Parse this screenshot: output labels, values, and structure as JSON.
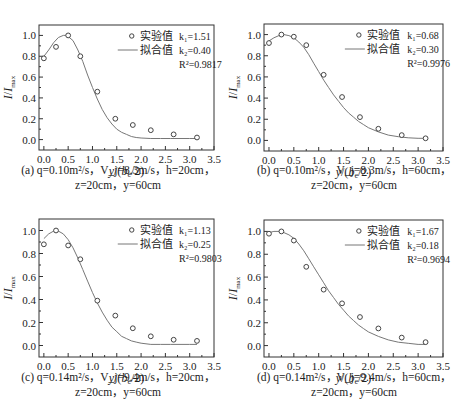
{
  "chart_data": [
    {
      "id": "a",
      "type": "line",
      "frame": {
        "left": 39,
        "top": 25,
        "right": 214,
        "bottom": 150
      },
      "xlim": [
        -0.1,
        3.5
      ],
      "ylim": [
        -0.1,
        1.1
      ],
      "xticks": [
        0.0,
        0.5,
        1.0,
        1.5,
        2.0,
        2.5,
        3.0,
        3.5
      ],
      "xtick_labels": [
        "0.0",
        "0.5",
        "1.0",
        "1.5",
        "2.0",
        "2.5",
        "3.0",
        "3.5"
      ],
      "yticks": [
        0.0,
        0.2,
        0.4,
        0.6,
        0.8,
        1.0
      ],
      "ytick_labels": [
        "0.0",
        "0.2",
        "0.4",
        "0.6",
        "0.8",
        "1.0"
      ],
      "xlabel": "y/(b_e/2)",
      "ylabel": "I/I_max",
      "legend": {
        "points": "实验值",
        "line": "拟合值"
      },
      "params": {
        "k1": "k₁=1.51",
        "k2": "k₂=0.40",
        "r2": "R²=0.9817"
      },
      "k1": 1.51,
      "k2": 0.4,
      "peak_x": 0.45,
      "start_y": 0.78,
      "series": [
        {
          "name": "实验值",
          "kind": "scatter",
          "x": [
            0.0,
            0.25,
            0.5,
            0.75,
            1.1,
            1.47,
            1.83,
            2.2,
            2.67,
            3.15
          ],
          "y": [
            0.78,
            0.89,
            1.0,
            0.8,
            0.46,
            0.2,
            0.14,
            0.09,
            0.05,
            0.02
          ]
        },
        {
          "name": "拟合值",
          "kind": "line",
          "x": [
            0.0,
            0.1,
            0.2,
            0.3,
            0.4,
            0.45,
            0.5,
            0.6,
            0.7,
            0.8,
            0.9,
            1.0,
            1.1,
            1.2,
            1.3,
            1.4,
            1.5,
            1.6,
            1.7,
            1.8,
            1.9,
            2.0,
            2.2,
            2.4,
            2.6,
            2.8,
            3.0,
            3.15
          ],
          "y": [
            0.8,
            0.86,
            0.93,
            0.98,
            1.0,
            1.0,
            0.99,
            0.95,
            0.86,
            0.75,
            0.62,
            0.5,
            0.39,
            0.29,
            0.21,
            0.15,
            0.1,
            0.07,
            0.05,
            0.03,
            0.02,
            0.015,
            0.01,
            0.01,
            0.01,
            0.01,
            0.01,
            0.01
          ]
        }
      ],
      "caption": {
        "line1": "(a) q=0.10m²/s，V_j=8.3m/s，h=20cm，",
        "line2": "z=20cm，y=60cm"
      }
    },
    {
      "id": "b",
      "type": "line",
      "frame": {
        "left": 264,
        "top": 24,
        "right": 443,
        "bottom": 151
      },
      "xlim": [
        -0.1,
        3.5
      ],
      "ylim": [
        -0.1,
        1.1
      ],
      "xticks": [
        0.0,
        0.5,
        1.0,
        1.5,
        2.0,
        2.5,
        3.0,
        3.5
      ],
      "xtick_labels": [
        "0.0",
        "0.5",
        "1.0",
        "1.5",
        "2.0",
        "2.5",
        "3.0",
        "3.5"
      ],
      "yticks": [
        0.0,
        0.2,
        0.4,
        0.6,
        0.8,
        1.0
      ],
      "ytick_labels": [
        "0.0",
        "0.2",
        "0.4",
        "0.6",
        "0.8",
        "1.0"
      ],
      "xlabel": "y/(b_e/2)",
      "ylabel": "I/I_max",
      "legend": {
        "points": "实验值",
        "line": "拟合值"
      },
      "params": {
        "k1": "k₁=0.68",
        "k2": "k₂=0.30",
        "r2": "R²=0.9976"
      },
      "series": [
        {
          "name": "实验值",
          "kind": "scatter",
          "x": [
            0.0,
            0.25,
            0.5,
            0.75,
            1.1,
            1.47,
            1.83,
            2.2,
            2.67,
            3.15
          ],
          "y": [
            0.92,
            1.0,
            0.98,
            0.9,
            0.62,
            0.41,
            0.22,
            0.11,
            0.05,
            0.02
          ]
        },
        {
          "name": "拟合值",
          "kind": "line",
          "x": [
            0.0,
            0.1,
            0.2,
            0.3,
            0.4,
            0.5,
            0.6,
            0.7,
            0.8,
            0.9,
            1.0,
            1.1,
            1.2,
            1.3,
            1.4,
            1.5,
            1.6,
            1.7,
            1.8,
            1.9,
            2.0,
            2.2,
            2.4,
            2.6,
            2.8,
            3.0,
            3.15
          ],
          "y": [
            0.94,
            0.97,
            0.99,
            1.0,
            0.99,
            0.97,
            0.93,
            0.88,
            0.81,
            0.73,
            0.65,
            0.57,
            0.5,
            0.43,
            0.37,
            0.31,
            0.26,
            0.22,
            0.18,
            0.15,
            0.12,
            0.08,
            0.05,
            0.035,
            0.025,
            0.02,
            0.02
          ]
        }
      ],
      "caption": {
        "line1": "(b) q=0.10m²/s，V_j=8.3m/s，h=60cm，",
        "line2": "z=20cm，y=60cm"
      }
    },
    {
      "id": "c",
      "type": "line",
      "frame": {
        "left": 39,
        "top": 219,
        "right": 214,
        "bottom": 357
      },
      "xlim": [
        -0.1,
        3.5
      ],
      "ylim": [
        -0.1,
        1.1
      ],
      "xticks": [
        0.0,
        0.5,
        1.0,
        1.5,
        2.0,
        2.5,
        3.0,
        3.5
      ],
      "xtick_labels": [
        "0.0",
        "0.5",
        "1.0",
        "1.5",
        "2.0",
        "2.5",
        "3.0",
        "3.5"
      ],
      "yticks": [
        0.0,
        0.2,
        0.4,
        0.6,
        0.8,
        1.0
      ],
      "ytick_labels": [
        "0.0",
        "0.2",
        "0.4",
        "0.6",
        "0.8",
        "1.0"
      ],
      "xlabel": "y/(b_e/2)",
      "ylabel": "I/I_max",
      "legend": {
        "points": "实验值",
        "line": "拟合值"
      },
      "params": {
        "k1": "k₁=1.13",
        "k2": "k₂=0.25",
        "r2": "R²=0.9803"
      },
      "series": [
        {
          "name": "实验值",
          "kind": "scatter",
          "x": [
            0.0,
            0.25,
            0.5,
            0.75,
            1.1,
            1.47,
            1.83,
            2.2,
            2.67,
            3.15
          ],
          "y": [
            0.88,
            1.0,
            0.87,
            0.75,
            0.39,
            0.26,
            0.15,
            0.08,
            0.05,
            0.04
          ]
        },
        {
          "name": "拟合值",
          "kind": "line",
          "x": [
            0.0,
            0.1,
            0.2,
            0.25,
            0.3,
            0.4,
            0.5,
            0.6,
            0.7,
            0.8,
            0.9,
            1.0,
            1.1,
            1.2,
            1.3,
            1.4,
            1.5,
            1.6,
            1.7,
            1.8,
            1.9,
            2.0,
            2.2,
            2.4,
            2.6,
            2.8,
            3.0,
            3.15
          ],
          "y": [
            0.93,
            0.97,
            0.995,
            1.0,
            0.995,
            0.97,
            0.92,
            0.85,
            0.76,
            0.66,
            0.56,
            0.46,
            0.37,
            0.29,
            0.22,
            0.16,
            0.12,
            0.08,
            0.06,
            0.04,
            0.03,
            0.02,
            0.01,
            0.01,
            0.01,
            0.01,
            0.01,
            0.01
          ]
        }
      ],
      "caption": {
        "line1": "(c) q=0.14m²/s，V_j=9.4m/s，h=20cm，",
        "line2": "z=20cm，y=60cm"
      }
    },
    {
      "id": "d",
      "type": "line",
      "frame": {
        "left": 264,
        "top": 220,
        "right": 443,
        "bottom": 357
      },
      "xlim": [
        -0.1,
        3.5
      ],
      "ylim": [
        -0.1,
        1.1
      ],
      "xticks": [
        0.0,
        0.5,
        1.0,
        1.5,
        2.0,
        2.5,
        3.0,
        3.5
      ],
      "xtick_labels": [
        "0.0",
        "0.5",
        "1.0",
        "1.5",
        "2.0",
        "2.5",
        "3.0",
        "3.5"
      ],
      "yticks": [
        0.0,
        0.2,
        0.4,
        0.6,
        0.8,
        1.0
      ],
      "ytick_labels": [
        "0.0",
        "0.2",
        "0.4",
        "0.6",
        "0.8",
        "1.0"
      ],
      "xlabel": "y/(b_e/2)",
      "ylabel": "I/I_max",
      "legend": {
        "points": "实验值",
        "line": "拟合值"
      },
      "params": {
        "k1": "k₁=1.67",
        "k2": "k₂=0.18",
        "r2": "R²=0.9694"
      },
      "series": [
        {
          "name": "实验值",
          "kind": "scatter",
          "x": [
            0.0,
            0.25,
            0.5,
            0.75,
            1.1,
            1.47,
            1.83,
            2.2,
            2.67,
            3.15
          ],
          "y": [
            0.98,
            1.0,
            0.92,
            0.69,
            0.49,
            0.37,
            0.25,
            0.15,
            0.07,
            0.03
          ]
        },
        {
          "name": "拟合值",
          "kind": "line",
          "x": [
            0.0,
            0.1,
            0.2,
            0.3,
            0.4,
            0.5,
            0.6,
            0.7,
            0.8,
            0.9,
            1.0,
            1.1,
            1.2,
            1.3,
            1.4,
            1.5,
            1.6,
            1.7,
            1.8,
            1.9,
            2.0,
            2.2,
            2.4,
            2.6,
            2.8,
            3.0,
            3.15
          ],
          "y": [
            0.99,
            1.0,
            1.0,
            0.99,
            0.97,
            0.94,
            0.89,
            0.83,
            0.76,
            0.69,
            0.62,
            0.55,
            0.48,
            0.42,
            0.36,
            0.31,
            0.26,
            0.22,
            0.18,
            0.15,
            0.12,
            0.08,
            0.05,
            0.03,
            0.02,
            0.01,
            0.01
          ]
        }
      ],
      "caption": {
        "line1": "(d) q=0.14m²/s，V_j=9.4m/s，h=60cm，",
        "line2": "z=20cm，y=60cm"
      }
    }
  ],
  "colors": {
    "frame": "#333333",
    "curve": "#777777",
    "marker": "#444444",
    "text": "#222222"
  }
}
